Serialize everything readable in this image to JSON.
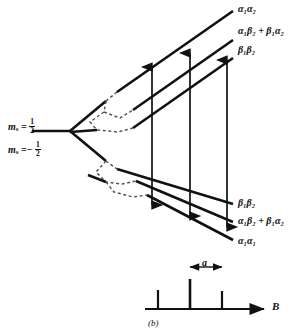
{
  "figure": {
    "caption": "(b)",
    "type": "energy-level-splitting-diagram",
    "axis_label": "B",
    "splitting_label": "a"
  },
  "left_labels": [
    {
      "id": "ms-plus",
      "symbol": "m",
      "subscript": "s",
      "equals": "=",
      "sign": "",
      "num": "1",
      "den": "2"
    },
    {
      "id": "ms-minus",
      "symbol": "m",
      "subscript": "s",
      "equals": "=",
      "sign": "−",
      "num": "1",
      "den": "2"
    }
  ],
  "upper_levels": [
    {
      "id": "upper-1",
      "text": "α₁α₂"
    },
    {
      "id": "upper-2",
      "text": "α₁β₂ + β₁α₂"
    },
    {
      "id": "upper-3",
      "text": "β₁β₂"
    }
  ],
  "lower_levels": [
    {
      "id": "lower-1",
      "text": "β₁β₂"
    },
    {
      "id": "lower-2",
      "text": "α₁β₂ + β₁α₂"
    },
    {
      "id": "lower-3",
      "text": "α₁α₁"
    }
  ],
  "transitions": [
    {
      "id": "transition-1"
    },
    {
      "id": "transition-2"
    },
    {
      "id": "transition-3"
    }
  ],
  "spectrum": {
    "axis_label": "B",
    "spacing_label": "a",
    "lines": [
      {
        "id": "spectrum-line-1",
        "x": 58,
        "height": 16
      },
      {
        "id": "spectrum-line-2",
        "x": 134,
        "height": 28
      },
      {
        "id": "spectrum-line-3",
        "x": 208,
        "height": 17
      }
    ]
  },
  "colors": {
    "ink": "#111111",
    "paper": "#ffffff",
    "dashed": "#555555"
  }
}
